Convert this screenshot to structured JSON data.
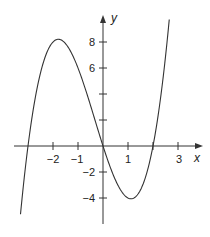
{
  "chart_data": {
    "type": "line",
    "title": "",
    "xlabel": "x",
    "ylabel": "y",
    "function": "y = x^3 + x^2 - 6x",
    "xlim": [
      -3.3,
      2.65
    ],
    "ylim": [
      -4.8,
      9.2
    ],
    "x_ticks": [
      -2,
      -1,
      1,
      3
    ],
    "x_tick_labels": [
      "−2",
      "−1",
      "1",
      "3"
    ],
    "x_ticks_unlabeled": [
      2
    ],
    "y_ticks": [
      8,
      6,
      4,
      -2,
      -4
    ],
    "y_tick_labels": [
      "8",
      "6",
      "",
      "−2",
      "−4"
    ],
    "grid": false,
    "legend": null,
    "series": [
      {
        "name": "curve",
        "x": [
          -3.3,
          -3.0,
          -2.5,
          -2.0,
          -1.5,
          -1.0,
          -0.5,
          0.0,
          0.5,
          1.0,
          1.5,
          2.0,
          2.5,
          2.65
        ],
        "y": [
          -5.2,
          0.0,
          5.6,
          8.0,
          7.9,
          6.0,
          3.1,
          0.0,
          -2.6,
          -4.0,
          -3.4,
          0.0,
          6.9,
          9.3
        ]
      }
    ],
    "key_points": {
      "roots": [
        -3,
        0,
        2
      ],
      "local_max": {
        "x": -1.79,
        "y": 8.2
      },
      "local_min": {
        "x": 1.12,
        "y": -4.06
      }
    }
  },
  "labels": {
    "x_axis": "x",
    "y_axis": "y",
    "xt_m2": "−2",
    "xt_m1": "−1",
    "xt_1": "1",
    "xt_3": "3",
    "yt_8": "8",
    "yt_6": "6",
    "yt_m2": "−2",
    "yt_m4": "−4"
  }
}
